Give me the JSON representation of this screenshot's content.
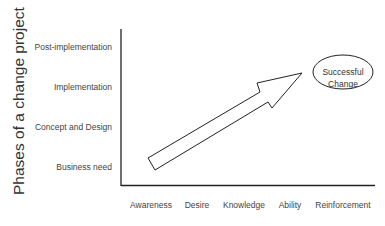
{
  "diagram": {
    "y_axis_title": "Phases of a change project",
    "y_ticks": [
      {
        "label": "Post-implementation",
        "y": 48
      },
      {
        "label": "Implementation",
        "y": 88
      },
      {
        "label": "Concept and Design",
        "y": 128
      },
      {
        "label": "Business need",
        "y": 168
      }
    ],
    "x_ticks": [
      {
        "label": "Awareness",
        "x": 151
      },
      {
        "label": "Desire",
        "x": 197
      },
      {
        "label": "Knowledge",
        "x": 244
      },
      {
        "label": "Ability",
        "x": 290
      },
      {
        "label": "Reinforcement",
        "x": 343
      }
    ],
    "goal": {
      "line1": "Successful",
      "line2": "Change"
    },
    "arrow": {
      "from": "Business need / Awareness",
      "to": "Successful Change"
    },
    "colors": {
      "line": "#222222",
      "text": "#444444",
      "background": "#ffffff"
    }
  }
}
